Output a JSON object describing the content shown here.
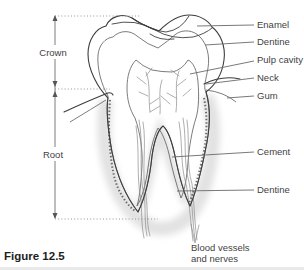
{
  "figure_caption": "Figure 12.5",
  "measure_labels": {
    "crown": "Crown",
    "root": "Root"
  },
  "part_labels": {
    "enamel": "Enamel",
    "dentine_upper": "Dentine",
    "pulp_cavity": "Pulp cavity",
    "neck": "Neck",
    "gum": "Gum",
    "cement": "Cement",
    "dentine_lower": "Dentine",
    "blood_vessels_line1": "Blood vessels",
    "blood_vessels_line2": "and nerves"
  },
  "colors": {
    "outline": "#3d3d3d",
    "dentine_fill": "#d9d9d9",
    "dentine_hatch": "#9e9e9e",
    "label_text": "#3f3f3f",
    "root_halo": "#e2e2e2",
    "background": "#ffffff"
  }
}
